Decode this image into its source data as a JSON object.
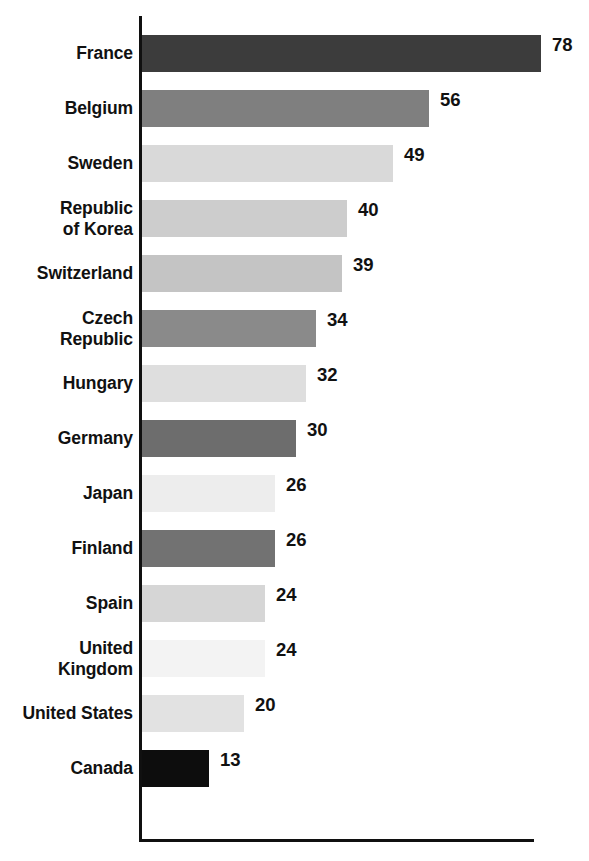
{
  "chart_data": {
    "type": "bar",
    "orientation": "horizontal",
    "title": "",
    "subtitle": "",
    "xlabel": "",
    "ylabel": "",
    "grid": false,
    "legend": false,
    "xlim": [
      0,
      78
    ],
    "categories": [
      "France",
      "Belgium",
      "Sweden",
      "Republic of Korea",
      "Switzerland",
      "Czech Republic",
      "Hungary",
      "Germany",
      "Japan",
      "Finland",
      "Spain",
      "United Kingdom",
      "United States",
      "Canada"
    ],
    "values": [
      78,
      56,
      49,
      40,
      39,
      34,
      32,
      30,
      26,
      26,
      24,
      24,
      20,
      13
    ],
    "bar_colors": [
      "#3c3c3c",
      "#7f7f7f",
      "#d9d9d9",
      "#cdcdcd",
      "#c4c4c4",
      "#8a8a8a",
      "#dedede",
      "#6d6d6d",
      "#ededed",
      "#727272",
      "#d6d6d6",
      "#f3f3f3",
      "#e2e2e2",
      "#0d0d0d"
    ],
    "bars": [
      {
        "label_lines": [
          "France"
        ],
        "value": 78,
        "value_text": "78",
        "color": "#3c3c3c"
      },
      {
        "label_lines": [
          "Belgium"
        ],
        "value": 56,
        "value_text": "56",
        "color": "#7f7f7f"
      },
      {
        "label_lines": [
          "Sweden"
        ],
        "value": 49,
        "value_text": "49",
        "color": "#d9d9d9"
      },
      {
        "label_lines": [
          "Republic",
          "of Korea"
        ],
        "value": 40,
        "value_text": "40",
        "color": "#cdcdcd"
      },
      {
        "label_lines": [
          "Switzerland"
        ],
        "value": 39,
        "value_text": "39",
        "color": "#c4c4c4"
      },
      {
        "label_lines": [
          "Czech",
          "Republic"
        ],
        "value": 34,
        "value_text": "34",
        "color": "#8a8a8a"
      },
      {
        "label_lines": [
          "Hungary"
        ],
        "value": 32,
        "value_text": "32",
        "color": "#dedede"
      },
      {
        "label_lines": [
          "Germany"
        ],
        "value": 30,
        "value_text": "30",
        "color": "#6d6d6d"
      },
      {
        "label_lines": [
          "Japan"
        ],
        "value": 26,
        "value_text": "26",
        "color": "#ededed"
      },
      {
        "label_lines": [
          "Finland"
        ],
        "value": 26,
        "value_text": "26",
        "color": "#727272"
      },
      {
        "label_lines": [
          "Spain"
        ],
        "value": 24,
        "value_text": "24",
        "color": "#d6d6d6"
      },
      {
        "label_lines": [
          "United",
          "Kingdom"
        ],
        "value": 24,
        "value_text": "24",
        "color": "#f3f3f3"
      },
      {
        "label_lines": [
          "United States"
        ],
        "value": 20,
        "value_text": "20",
        "color": "#e2e2e2"
      },
      {
        "label_lines": [
          "Canada"
        ],
        "value": 13,
        "value_text": "13",
        "color": "#0d0d0d"
      }
    ],
    "axis_color": "#101010",
    "background_color": "#ffffff",
    "pixels_per_unit": 5.12
  }
}
